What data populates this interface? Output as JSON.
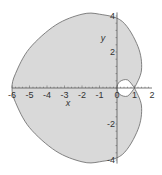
{
  "chart_data": {
    "type": "line",
    "title": "",
    "xlabel": "x",
    "ylabel": "y",
    "xlim": [
      -6,
      2
    ],
    "ylim": [
      -4,
      4
    ],
    "x_ticks": [
      "-6",
      "-5",
      "-4",
      "-3",
      "-2",
      "-1",
      "0",
      "1",
      "2"
    ],
    "y_ticks": [
      "4",
      "2",
      "-2",
      "-4"
    ],
    "grid": false,
    "fill_color": "#d9d9d9",
    "line_color": "#666666",
    "series": [
      {
        "name": "outer loop",
        "points": [
          [
            1,
            0
          ],
          [
            1.4,
            1
          ],
          [
            1.2,
            2.3
          ],
          [
            0.3,
            3.7
          ],
          [
            -1,
            4.1
          ],
          [
            -2,
            4.1
          ],
          [
            -3.5,
            3.5
          ],
          [
            -5,
            2.2
          ],
          [
            -5.8,
            0.8
          ],
          [
            -6,
            0
          ],
          [
            -5.8,
            -0.8
          ],
          [
            -5,
            -2.2
          ],
          [
            -3.5,
            -3.5
          ],
          [
            -2,
            -4.1
          ],
          [
            -1,
            -4.1
          ],
          [
            0.3,
            -3.7
          ],
          [
            1.2,
            -2.3
          ],
          [
            1.4,
            -1
          ],
          [
            1,
            0
          ]
        ]
      },
      {
        "name": "inner loop",
        "points": [
          [
            1,
            0
          ],
          [
            0.6,
            0.45
          ],
          [
            0.15,
            0.35
          ],
          [
            0,
            0
          ],
          [
            0.15,
            -0.35
          ],
          [
            0.6,
            -0.45
          ],
          [
            1,
            0
          ]
        ]
      }
    ]
  }
}
